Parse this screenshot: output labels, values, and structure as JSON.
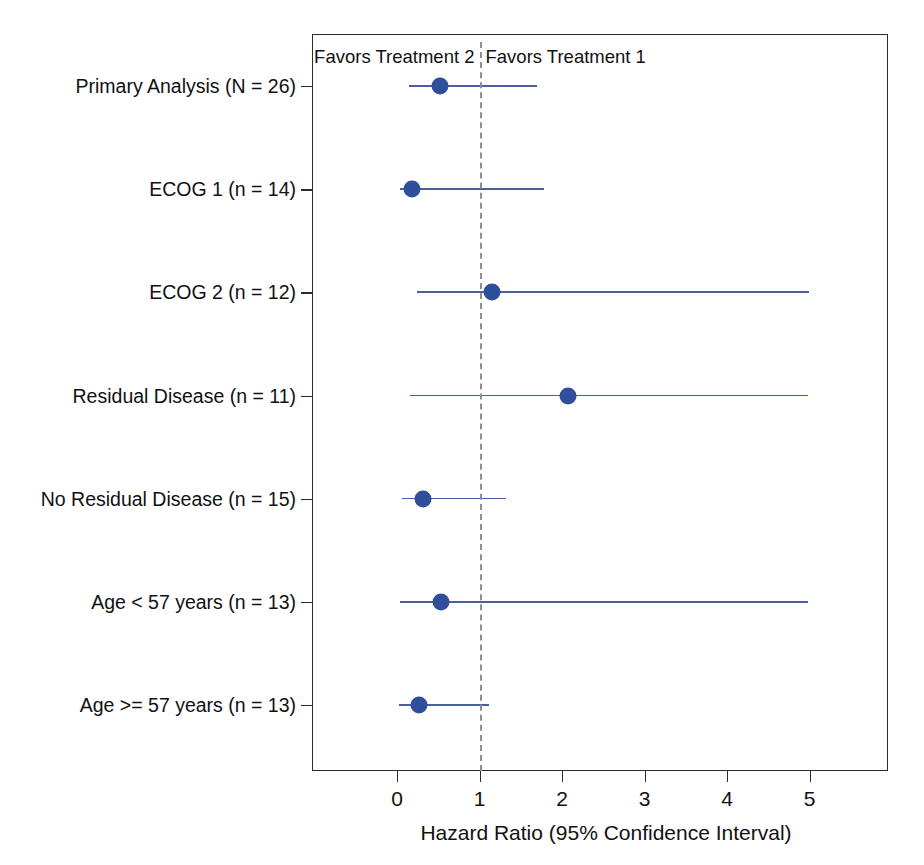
{
  "chart_data": {
    "type": "scatter",
    "subtype": "forest-plot",
    "title": "",
    "xlabel": "Hazard Ratio (95% Confidence Interval)",
    "ylabel": "",
    "xticks": [
      0,
      1,
      2,
      3,
      4,
      5
    ],
    "xticklabels": [
      "0",
      "1",
      "2",
      "3",
      "4",
      "5"
    ],
    "xlim": [
      -0.55,
      5.95
    ],
    "grid": false,
    "legend": null,
    "reference_line": 1.0,
    "annotations": [
      {
        "text": "Favors Treatment 2",
        "x": 1.0,
        "align": "left-of-x"
      },
      {
        "text": "Favors Treatment 1",
        "x": 1.0,
        "align": "right-of-x"
      }
    ],
    "categories": [
      "Primary Analysis (N = 26)",
      "ECOG 1 (n = 14)",
      "ECOG 2 (n = 12)",
      "Residual Disease (n = 11)",
      "No Residual Disease (n = 15)",
      "Age < 57 years (n = 13)",
      "Age >= 57 years (n = 13)"
    ],
    "points": [
      {
        "label": "Primary Analysis (N = 26)",
        "hr": 0.52,
        "ci_low": 0.15,
        "ci_high": 1.7
      },
      {
        "label": "ECOG 1 (n = 14)",
        "hr": 0.18,
        "ci_low": 0.04,
        "ci_high": 1.78
      },
      {
        "label": "ECOG 2 (n = 12)",
        "hr": 1.15,
        "ci_low": 0.24,
        "ci_high": 5.0
      },
      {
        "label": "Residual Disease (n = 11)",
        "hr": 2.07,
        "ci_low": 0.16,
        "ci_high": 4.98
      },
      {
        "label": "No Residual Disease (n = 15)",
        "hr": 0.31,
        "ci_low": 0.06,
        "ci_high": 1.32
      },
      {
        "label": "Age < 57 years (n = 13)",
        "hr": 0.53,
        "ci_low": 0.04,
        "ci_high": 4.98
      },
      {
        "label": "Age >= 57 years (n = 13)",
        "hr": 0.27,
        "ci_low": 0.02,
        "ci_high": 1.12
      }
    ],
    "colors": {
      "point": "#2f4f9b",
      "ci_line": "#4a5fa0",
      "reference_line": "#8f8f8f",
      "axis": "#2b2b2b",
      "text": "#111111",
      "background": "#ffffff"
    }
  }
}
